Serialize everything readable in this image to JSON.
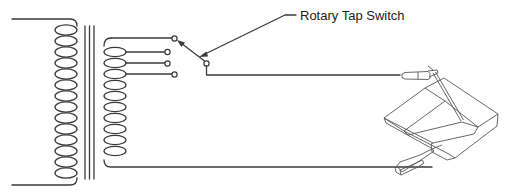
{
  "diagram": {
    "labels": {
      "switch_label": "Rotary Tap Switch"
    },
    "components": [
      {
        "name": "primary-coil",
        "turns": 14
      },
      {
        "name": "iron-core",
        "lines": 3
      },
      {
        "name": "secondary-coil",
        "turns": 10,
        "taps": 4
      },
      {
        "name": "rotary-tap-switch"
      },
      {
        "name": "electrode-holder"
      },
      {
        "name": "workpiece"
      },
      {
        "name": "ground-clamp"
      }
    ],
    "colors": {
      "line": "#3a3a3a",
      "background": "#ffffff",
      "text": "#222222"
    }
  }
}
